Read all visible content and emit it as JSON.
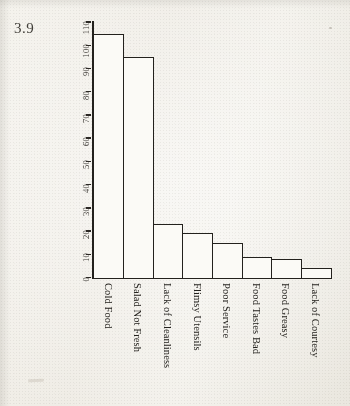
{
  "figure": {
    "number": "3.9"
  },
  "chart_data": {
    "type": "bar",
    "title": "",
    "xlabel": "",
    "ylabel": "",
    "categories": [
      "Cold Food",
      "Salad Not Fresh",
      "Lack of Cleanliness",
      "Flimsy Utensils",
      "Poor Service",
      "Food Tastes Bad",
      "Food Greasy",
      "Lack of Courtesy"
    ],
    "values": [
      105,
      95,
      23,
      19,
      15,
      9,
      8,
      4
    ],
    "ylim": [
      0,
      110
    ],
    "ytick_labels": [
      "110",
      "100",
      "90",
      "80",
      "70",
      "60",
      "50",
      "40",
      "30",
      "20",
      "10",
      "0"
    ],
    "ytick_values": [
      110,
      100,
      90,
      80,
      70,
      60,
      50,
      40,
      30,
      20,
      10,
      0
    ],
    "grid": false,
    "legend": false,
    "orientation": "vertical",
    "bar_fill_color": "#fbfaf6",
    "bar_edge_color": "#23211d",
    "paper_color": "#f2f0ea"
  }
}
